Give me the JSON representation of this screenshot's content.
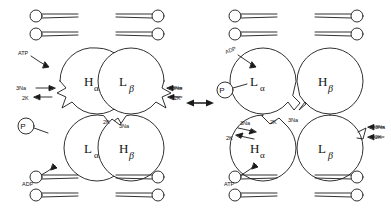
{
  "figure": {
    "stroke_color": "#1a1a1a",
    "fill_color": "#ffffff",
    "background": "#ffffff"
  },
  "transition": {
    "symbol": "↔",
    "name": "double-headed-equilibrium-arrow"
  },
  "left_state": {
    "subunits": [
      {
        "id": "upper-left",
        "base": "H",
        "greek": "α"
      },
      {
        "id": "upper-right",
        "base": "L",
        "greek": "β"
      },
      {
        "id": "lower-left",
        "base": "L",
        "greek": "α"
      },
      {
        "id": "lower-right",
        "base": "H",
        "greek": "β"
      }
    ],
    "ligands": [
      {
        "id": "atp",
        "label": "ATP"
      },
      {
        "id": "adp",
        "label": "ADP"
      },
      {
        "id": "phosphate",
        "label": "P"
      }
    ],
    "ion_labels": [
      {
        "id": "outer-left-na",
        "label": "3Na",
        "arrow": "→"
      },
      {
        "id": "outer-left-k",
        "label": "2K",
        "arrow": "←"
      },
      {
        "id": "outer-right-na",
        "label": "3Na",
        "arrow": "←"
      },
      {
        "id": "outer-right-k",
        "label": "2K",
        "arrow": "←"
      },
      {
        "id": "cleft-k",
        "label": "2K",
        "arrow": ""
      },
      {
        "id": "cleft-na",
        "label": "3Na",
        "arrow": ""
      }
    ]
  },
  "right_state": {
    "subunits": [
      {
        "id": "upper-left",
        "base": "L",
        "greek": "α"
      },
      {
        "id": "upper-right",
        "base": "H",
        "greek": "β"
      },
      {
        "id": "lower-left",
        "base": "H",
        "greek": "α"
      },
      {
        "id": "lower-right",
        "base": "L",
        "greek": "β"
      }
    ],
    "ligands": [
      {
        "id": "adp",
        "label": "ADP"
      },
      {
        "id": "atp",
        "label": "ATP"
      },
      {
        "id": "phosphate",
        "label": "P"
      }
    ],
    "ion_labels": [
      {
        "id": "cleft-k",
        "label": "2K",
        "arrow": ""
      },
      {
        "id": "cleft-na",
        "label": "3Na",
        "arrow": ""
      },
      {
        "id": "outer-left-na",
        "label": "3Na",
        "arrow": "→"
      },
      {
        "id": "outer-left-k",
        "label": "2K",
        "arrow": "←"
      },
      {
        "id": "outer-right-na",
        "label": "3Na",
        "arrow": "←"
      },
      {
        "id": "outer-right-k",
        "label": "2K",
        "arrow": "←"
      }
    ]
  },
  "membrane": {
    "name": "phospholipid-bilayer",
    "leaflets": [
      "top",
      "bottom"
    ],
    "lipids_per_group": 2
  }
}
